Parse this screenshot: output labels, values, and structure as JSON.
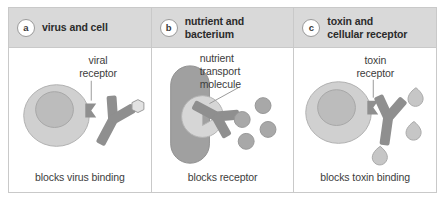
{
  "figure": {
    "panels": [
      {
        "badge": "a",
        "title": "virus and cell",
        "art_label": "viral\nreceptor",
        "caption": "blocks virus binding",
        "elements": [
          "cell",
          "nucleus",
          "viral-receptor",
          "antibody",
          "virus-particle"
        ]
      },
      {
        "badge": "b",
        "title": "nutrient and\nbacterium",
        "art_label": "nutrient\ntransport\nmolecule",
        "caption": "blocks receptor",
        "elements": [
          "bacterium",
          "transport-molecule",
          "antibody",
          "nutrient-particle"
        ]
      },
      {
        "badge": "c",
        "title": "toxin and\ncellular receptor",
        "art_label": "toxin\nreceptor",
        "caption": "blocks toxin binding",
        "elements": [
          "cell",
          "nucleus",
          "toxin-receptor",
          "antibody",
          "toxin-particle"
        ]
      }
    ]
  },
  "colors": {
    "header_background": "#d9d9d9",
    "border": "#c9c9c9",
    "cell_body": "#d0d0d0",
    "cell_nucleus": "#b9b9b9",
    "bacterium": "#a0a0a0",
    "antibody": "#8f8f8f",
    "receptor": "#8f8f8f",
    "particle": "#a8a8a8",
    "toxin": "#c6c6c6",
    "text": "#3c3c3c",
    "title_text": "#2b2b2b",
    "leader_line": "#9a9a9a"
  }
}
